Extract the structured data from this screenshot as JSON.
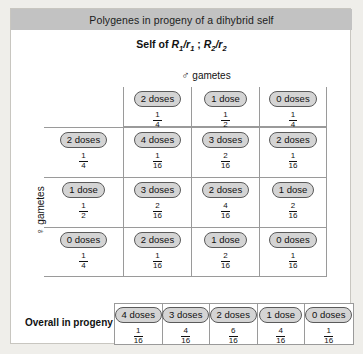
{
  "title": "Polygenes in progeny of a dihybrid self",
  "subtitle": {
    "prefix": "Self of ",
    "gene1_upper": "R",
    "gene1_upper_sub": "1",
    "slash1": "/",
    "gene1_lower": "r",
    "gene1_lower_sub": "1",
    "separator": " ; ",
    "gene2_upper": "R",
    "gene2_upper_sub": "2",
    "slash2": "/",
    "gene2_lower": "r",
    "gene2_lower_sub": "2"
  },
  "axes": {
    "male_symbol": "♂",
    "male_label": "gametes",
    "female_symbol": "♀",
    "female_label": "gametes"
  },
  "column_headers": [
    {
      "dose": "2 doses",
      "num": "1",
      "den": "4"
    },
    {
      "dose": "1 dose",
      "num": "1",
      "den": "2"
    },
    {
      "dose": "0 doses",
      "num": "1",
      "den": "4"
    }
  ],
  "row_headers": [
    {
      "dose": "2 doses",
      "num": "1",
      "den": "4"
    },
    {
      "dose": "1 dose",
      "num": "1",
      "den": "2"
    },
    {
      "dose": "0 doses",
      "num": "1",
      "den": "4"
    }
  ],
  "grid": [
    [
      {
        "dose": "4 doses",
        "num": "1",
        "den": "16"
      },
      {
        "dose": "3 doses",
        "num": "2",
        "den": "16"
      },
      {
        "dose": "2 doses",
        "num": "1",
        "den": "16"
      }
    ],
    [
      {
        "dose": "3 doses",
        "num": "2",
        "den": "16"
      },
      {
        "dose": "2 doses",
        "num": "4",
        "den": "16"
      },
      {
        "dose": "1 dose",
        "num": "2",
        "den": "16"
      }
    ],
    [
      {
        "dose": "2 doses",
        "num": "1",
        "den": "16"
      },
      {
        "dose": "1 dose",
        "num": "2",
        "den": "16"
      },
      {
        "dose": "0 doses",
        "num": "1",
        "den": "16"
      }
    ]
  ],
  "overall": {
    "label": "Overall in progeny",
    "cells": [
      {
        "dose": "4 doses",
        "num": "1",
        "den": "16"
      },
      {
        "dose": "3 doses",
        "num": "4",
        "den": "16"
      },
      {
        "dose": "2 doses",
        "num": "6",
        "den": "16"
      },
      {
        "dose": "1 dose",
        "num": "4",
        "den": "16"
      },
      {
        "dose": "0 doses",
        "num": "1",
        "den": "16"
      }
    ]
  },
  "colors": {
    "title_band": "#c2c2c2",
    "pill_fill": "#d4d4d4",
    "pill_border": "#5a5a5a",
    "grid_line": "#9a9a9a",
    "page_background": "#efeeea",
    "card_background": "#ffffff"
  }
}
